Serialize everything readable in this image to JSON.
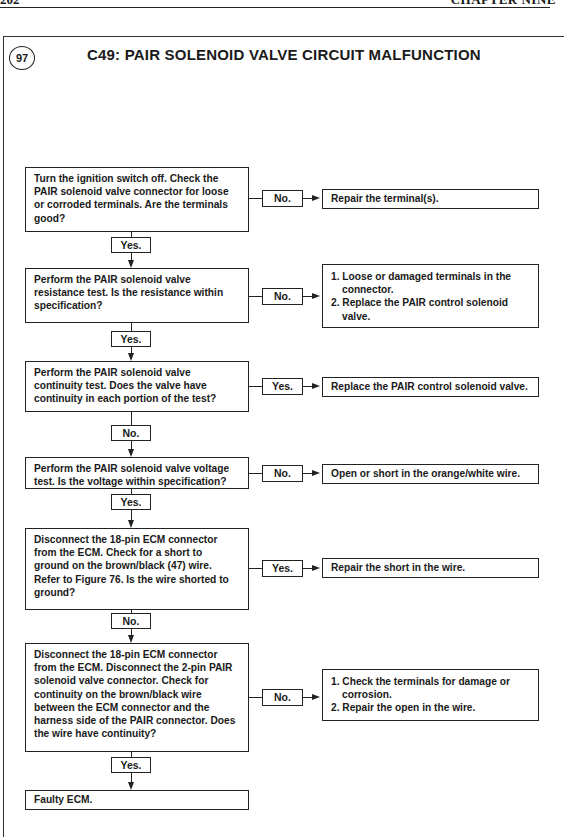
{
  "page_header": {
    "page_number": "202",
    "chapter": "CHAPTER NINE"
  },
  "figure": {
    "number": "97",
    "title": "C49: PAIR SOLENOID VALVE CIRCUIT MALFUNCTION"
  },
  "flowchart": {
    "steps": [
      {
        "question": "Turn the ignition switch off. Check the PAIR solenoid valve connector for loose or corroded terminals. Are the terminals good?",
        "side_label": "No.",
        "side_result": "Repair the terminal(s).",
        "down_label": "Yes."
      },
      {
        "question": "Perform the PAIR solenoid valve resistance test. Is the resistance within specification?",
        "side_label": "No.",
        "side_result_items": [
          "1. Loose or damaged terminals in the connector.",
          "2. Replace the PAIR control solenoid valve."
        ],
        "down_label": "Yes."
      },
      {
        "question": "Perform the PAIR solenoid valve continuity test. Does the valve have continuity in each portion of the test?",
        "side_label": "Yes.",
        "side_result": "Replace the PAIR control solenoid valve.",
        "down_label": "No."
      },
      {
        "question": "Perform the PAIR solenoid valve voltage test. Is the voltage within specification?",
        "side_label": "No.",
        "side_result": "Open or short in the orange/white wire.",
        "down_label": "Yes."
      },
      {
        "question_pre": "Disconnect the 18-pin ECM connector from the ECM. Check for a short to ground on the brown/black (47) wire. Refer to ",
        "question_ref": "Figure 76",
        "question_post": ". Is the wire shorted to ground?",
        "side_label": "Yes.",
        "side_result": "Repair the short in the wire.",
        "down_label": "No."
      },
      {
        "question": "Disconnect the 18-pin ECM connector from the ECM. Disconnect the 2-pin PAIR solenoid valve connector. Check for continuity on the brown/black wire between the ECM connector and the harness side of the PAIR connector. Does the wire have continuity?",
        "side_label": "No.",
        "side_result_items": [
          "1. Check the terminals for damage or corrosion.",
          "2. Repair the open in the wire."
        ],
        "down_label": "Yes."
      }
    ],
    "final": "Faulty ECM."
  }
}
